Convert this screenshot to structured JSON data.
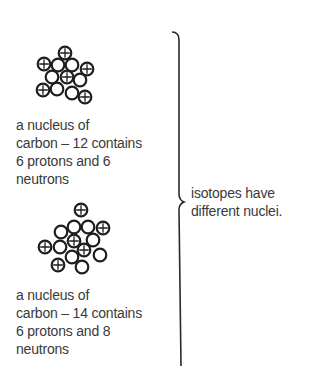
{
  "nuclei": [
    {
      "id": "carbon-12",
      "protons": 6,
      "neutrons": 6,
      "caption_lines": [
        "a nucleus of",
        "carbon – 12  contains",
        "6 protons and 6",
        "neutrons"
      ]
    },
    {
      "id": "carbon-14",
      "protons": 6,
      "neutrons": 8,
      "caption_lines": [
        "a nucleus of",
        "carbon – 14  contains",
        "6 protons and 8",
        "neutrons"
      ]
    }
  ],
  "conclusion_lines": [
    "isotopes have",
    "different nuclei."
  ],
  "legend": {
    "proton_icon": "circle-plus",
    "neutron_icon": "circle"
  }
}
